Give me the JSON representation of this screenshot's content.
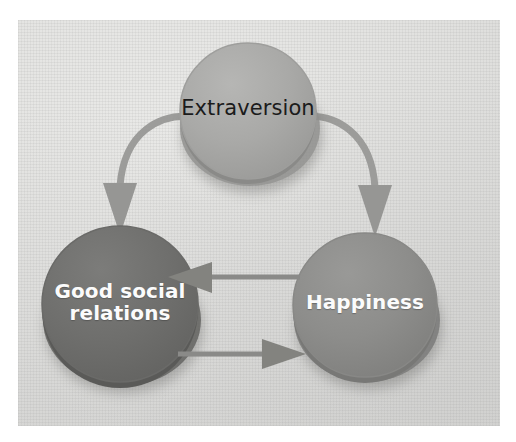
{
  "figure": {
    "type": "cycle-diagram",
    "background_color": "#e4e4e2",
    "page_color": "#ffffff"
  },
  "nodes": [
    {
      "id": "extraversion",
      "label": "Extraversion",
      "shape": "circle",
      "fill_color": "#a9a9a7",
      "rim_color": "#8b8b89",
      "text_color": "#1b1b1b",
      "text_weight": "regular",
      "cx": 248,
      "cy": 113,
      "r": 68
    },
    {
      "id": "good-social-relations",
      "label": "Good social\nrelations",
      "shape": "circle",
      "fill_color": "#6f6f6d",
      "rim_color": "#5a5a58",
      "text_color": "#fbfbfb",
      "text_weight": "bold",
      "cx": 120,
      "cy": 305,
      "r": 78
    },
    {
      "id": "happiness",
      "label": "Happiness",
      "shape": "circle",
      "fill_color": "#8d8d8b",
      "rim_color": "#737371",
      "text_color": "#fbfbfb",
      "text_weight": "bold",
      "cx": 365,
      "cy": 305,
      "r": 72
    }
  ],
  "edges": [
    {
      "id": "extraversion-to-good-social-relations",
      "from": "extraversion",
      "to": "good-social-relations",
      "style": "curved",
      "direction": "down-left",
      "color": "#9a9a98"
    },
    {
      "id": "extraversion-to-happiness",
      "from": "extraversion",
      "to": "happiness",
      "style": "curved",
      "direction": "down-right",
      "color": "#9a9a98"
    },
    {
      "id": "happiness-to-good-social-relations",
      "from": "happiness",
      "to": "good-social-relations",
      "style": "straight",
      "direction": "left",
      "color": "#8a8a88"
    },
    {
      "id": "good-social-relations-to-happiness",
      "from": "good-social-relations",
      "to": "happiness",
      "style": "straight",
      "direction": "right",
      "color": "#8a8a88"
    }
  ]
}
